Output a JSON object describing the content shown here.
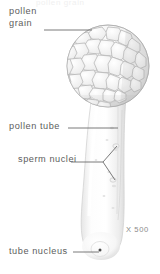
{
  "figure": {
    "background_color": "#ffffff",
    "ink_color": "#5d5d5d",
    "leader_color": "#6b6b6b",
    "cropped_text_above": "pollen grain",
    "magnification": "X 500",
    "labels": [
      {
        "id": "pollen-grain",
        "text_line_1": "pollen",
        "text_line_2": "grain",
        "full_text": "pollen grain"
      },
      {
        "id": "pollen-tube",
        "full_text": "pollen tube"
      },
      {
        "id": "sperm-nuclei",
        "full_text": "sperm nuclei"
      },
      {
        "id": "tube-nucleus",
        "full_text": "tube nucleus"
      }
    ],
    "structures": [
      {
        "id": "pollen-grain-body",
        "description": "spherical reticulate pollen grain"
      },
      {
        "id": "pollen-tube-body",
        "description": "elongated curving pollen tube"
      },
      {
        "id": "sperm-nucleus-1",
        "description": "upper sperm nucleus"
      },
      {
        "id": "sperm-nucleus-2",
        "description": "lower sperm nucleus"
      },
      {
        "id": "tube-nucleus-dot",
        "description": "dark tube nucleus at tube tip"
      }
    ]
  }
}
